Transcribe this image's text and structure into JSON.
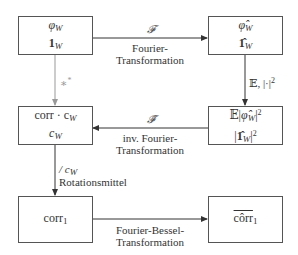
{
  "diagram": {
    "type": "flowchart",
    "nodes": [
      {
        "id": "phi_w",
        "lines": [
          "φ_W",
          "1_W"
        ]
      },
      {
        "id": "phi_hat_w",
        "lines": [
          "φ̂_W",
          "1̂_W"
        ]
      },
      {
        "id": "corr_cw",
        "lines": [
          "corr · c_W",
          "c_W"
        ]
      },
      {
        "id": "power",
        "lines": [
          "𝔼|φ̂_W|²",
          "|1̂_W|²"
        ]
      },
      {
        "id": "corr1",
        "lines": [
          "corr_1"
        ]
      },
      {
        "id": "corr1_hat",
        "lines": [
          "côrr_1"
        ]
      }
    ],
    "edges": [
      {
        "from": "phi_w",
        "to": "phi_hat_w",
        "symbol": "𝓕",
        "label_line1": "Fourier-",
        "label_line2": "Transformation"
      },
      {
        "from": "phi_hat_w",
        "to": "power",
        "symbol": "𝔼, |·|²"
      },
      {
        "from": "power",
        "to": "corr_cw",
        "symbol": "𝓕̃",
        "label_line1": "inv. Fourier-",
        "label_line2": "Transformation"
      },
      {
        "from": "phi_w",
        "to": "corr_cw",
        "symbol": "∗*",
        "style": "gray"
      },
      {
        "from": "corr_cw",
        "to": "corr1",
        "symbol": "/ c_W",
        "label_line1": "Rotationsmittel"
      },
      {
        "from": "corr1",
        "to": "corr1_hat",
        "label_line1": "Fourier-Bessel-",
        "label_line2": "Transformation"
      }
    ]
  },
  "text": {
    "n1_a_main": "φ",
    "n1_a_sub": "W",
    "n1_b_main": "1",
    "n1_b_sub": "W",
    "n2_a_main": "φ̂",
    "n2_a_sub": "W",
    "n2_b_main": "1̂",
    "n2_b_sub": "W",
    "n3_a_main": "corr · c",
    "n3_a_sub": "W",
    "n3_b_main": "c",
    "n3_b_sub": "W",
    "n4_a_pre": "𝔼|",
    "n4_a_main": "φ̂",
    "n4_a_sub": "W",
    "n4_a_post": "|",
    "n4_a_sup": "2",
    "n4_b_pre": "|",
    "n4_b_main": "1̂",
    "n4_b_sub": "W",
    "n4_b_post": "|",
    "n4_b_sup": "2",
    "n5_main": "corr",
    "n5_sub": "1",
    "n6_main": "côrr",
    "n6_sub": "1",
    "e1_symbol": "𝓕",
    "e1_l1": "Fourier-",
    "e1_l2": "Transformation",
    "e2_symbol": "𝔼, |·|",
    "e2_sup": "2",
    "e3_symbol": "𝓕̃",
    "e3_l1": "inv. Fourier-",
    "e3_l2": "Transformation",
    "e4_symbol": "∗",
    "e4_sup": "*",
    "e5_symbol": "/ c",
    "e5_sub": "W",
    "e5_l1": "Rotationsmittel",
    "e6_l1": "Fourier-Bessel-",
    "e6_l2": "Transformation"
  },
  "colors": {
    "box_border": "#555555",
    "arrow": "#333333",
    "arrow_gray": "#999999",
    "text": "#333333"
  }
}
